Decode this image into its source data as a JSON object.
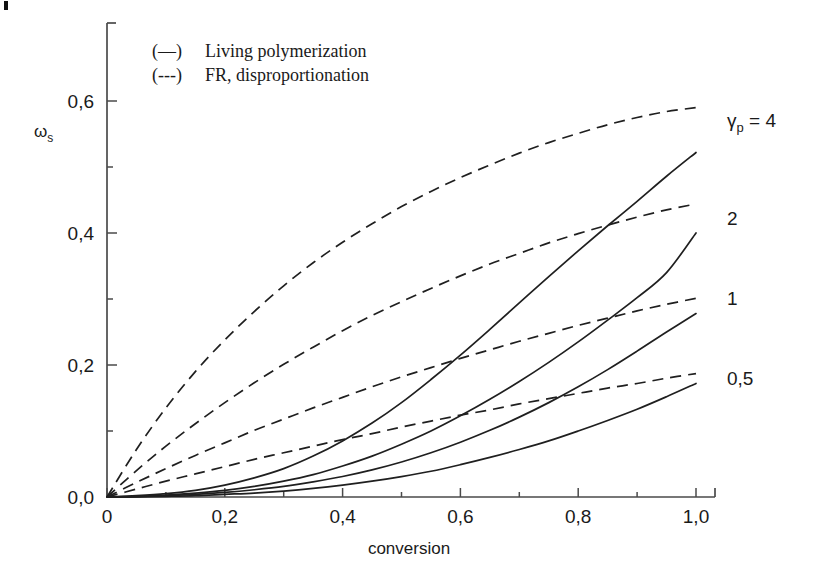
{
  "chart_data": {
    "type": "line",
    "title": "",
    "xlabel": "conversion",
    "ylabel": "ωs",
    "ylabel_parts": {
      "symbol": "ω",
      "sub": "s"
    },
    "xlim": [
      0,
      1.0
    ],
    "ylim": [
      0,
      0.68
    ],
    "grid": false,
    "legend_position": "top-left-inside",
    "x_ticks": [
      "0",
      "0,2",
      "0,4",
      "0,6",
      "0,8",
      "1,0"
    ],
    "x_tick_values": [
      0,
      0.2,
      0.4,
      0.6,
      0.8,
      1.0
    ],
    "x_minor_ticks": [
      0.1,
      0.3,
      0.5,
      0.7,
      0.9
    ],
    "y_ticks": [
      "0,0",
      "0,2",
      "0,4",
      "0,6"
    ],
    "y_tick_values": [
      0.0,
      0.2,
      0.4,
      0.6
    ],
    "y_minor_ticks": [
      0.1,
      0.3,
      0.5
    ],
    "legend": [
      {
        "marker": "(—)",
        "label": "Living polymerization",
        "style": "solid"
      },
      {
        "marker": "(---)",
        "label": "FR, disproportionation",
        "style": "dashed"
      }
    ],
    "curve_labels": [
      {
        "text": "γp = 4",
        "symbol": "γ",
        "sub": "p",
        "rest": " = 4",
        "value": 4
      },
      {
        "text": "2",
        "value": 2
      },
      {
        "text": "1",
        "value": 1
      },
      {
        "text": "0,5",
        "value": 0.5
      }
    ],
    "series": [
      {
        "name": "FR, disproportionation γp = 4",
        "style": "dashed",
        "gamma_p": 4,
        "x": [
          0,
          0.05,
          0.1,
          0.15,
          0.2,
          0.25,
          0.3,
          0.35,
          0.4,
          0.45,
          0.5,
          0.55,
          0.6,
          0.65,
          0.7,
          0.75,
          0.8,
          0.85,
          0.9,
          0.95,
          1.0
        ],
        "y": [
          0.0,
          0.072,
          0.135,
          0.19,
          0.238,
          0.281,
          0.32,
          0.355,
          0.386,
          0.414,
          0.44,
          0.463,
          0.484,
          0.503,
          0.521,
          0.537,
          0.551,
          0.564,
          0.575,
          0.584,
          0.59
        ]
      },
      {
        "name": "FR, disproportionation γp = 2",
        "style": "dashed",
        "gamma_p": 2,
        "x": [
          0,
          0.05,
          0.1,
          0.15,
          0.2,
          0.25,
          0.3,
          0.35,
          0.4,
          0.45,
          0.5,
          0.55,
          0.6,
          0.65,
          0.7,
          0.75,
          0.8,
          0.85,
          0.9,
          0.95,
          1.0
        ],
        "y": [
          0.0,
          0.04,
          0.077,
          0.111,
          0.143,
          0.173,
          0.201,
          0.227,
          0.252,
          0.275,
          0.296,
          0.316,
          0.335,
          0.353,
          0.369,
          0.385,
          0.399,
          0.412,
          0.424,
          0.435,
          0.444
        ]
      },
      {
        "name": "FR, disproportionation γp = 1",
        "style": "dashed",
        "gamma_p": 1,
        "x": [
          0,
          0.05,
          0.1,
          0.15,
          0.2,
          0.25,
          0.3,
          0.35,
          0.4,
          0.45,
          0.5,
          0.55,
          0.6,
          0.65,
          0.7,
          0.75,
          0.8,
          0.85,
          0.9,
          0.95,
          1.0
        ],
        "y": [
          0.0,
          0.022,
          0.043,
          0.063,
          0.082,
          0.101,
          0.118,
          0.135,
          0.151,
          0.167,
          0.182,
          0.196,
          0.21,
          0.223,
          0.236,
          0.248,
          0.26,
          0.271,
          0.282,
          0.292,
          0.301
        ]
      },
      {
        "name": "FR, disproportionation γp = 0,5",
        "style": "dashed",
        "gamma_p": 0.5,
        "x": [
          0,
          0.05,
          0.1,
          0.15,
          0.2,
          0.25,
          0.3,
          0.35,
          0.4,
          0.45,
          0.5,
          0.55,
          0.6,
          0.65,
          0.7,
          0.75,
          0.8,
          0.85,
          0.9,
          0.95,
          1.0
        ],
        "y": [
          0.0,
          0.012,
          0.024,
          0.035,
          0.046,
          0.057,
          0.067,
          0.077,
          0.087,
          0.096,
          0.106,
          0.115,
          0.124,
          0.132,
          0.141,
          0.149,
          0.157,
          0.165,
          0.172,
          0.18,
          0.187
        ]
      },
      {
        "name": "Living polymerization γp = 4",
        "style": "solid",
        "gamma_p": 4,
        "x": [
          0,
          0.05,
          0.1,
          0.15,
          0.2,
          0.25,
          0.3,
          0.35,
          0.4,
          0.45,
          0.5,
          0.55,
          0.6,
          0.65,
          0.7,
          0.75,
          0.8,
          0.85,
          0.9,
          0.95,
          1.0
        ],
        "y": [
          0.0,
          0.002,
          0.005,
          0.01,
          0.018,
          0.029,
          0.043,
          0.062,
          0.085,
          0.112,
          0.143,
          0.178,
          0.215,
          0.254,
          0.294,
          0.334,
          0.373,
          0.411,
          0.448,
          0.486,
          0.522
        ]
      },
      {
        "name": "Living polymerization γp = 2",
        "style": "solid",
        "gamma_p": 2,
        "x": [
          0,
          0.05,
          0.1,
          0.15,
          0.2,
          0.25,
          0.3,
          0.35,
          0.4,
          0.45,
          0.5,
          0.55,
          0.6,
          0.65,
          0.7,
          0.75,
          0.8,
          0.85,
          0.9,
          0.95,
          1.0
        ],
        "y": [
          0.0,
          0.001,
          0.003,
          0.006,
          0.01,
          0.016,
          0.024,
          0.034,
          0.047,
          0.062,
          0.08,
          0.1,
          0.123,
          0.148,
          0.175,
          0.204,
          0.235,
          0.268,
          0.302,
          0.34,
          0.4
        ]
      },
      {
        "name": "Living polymerization γp = 1",
        "style": "solid",
        "gamma_p": 1,
        "x": [
          0,
          0.05,
          0.1,
          0.15,
          0.2,
          0.25,
          0.3,
          0.35,
          0.4,
          0.45,
          0.5,
          0.55,
          0.6,
          0.65,
          0.7,
          0.75,
          0.8,
          0.85,
          0.9,
          0.95,
          1.0
        ],
        "y": [
          0.0,
          0.0005,
          0.002,
          0.004,
          0.007,
          0.011,
          0.016,
          0.023,
          0.031,
          0.041,
          0.053,
          0.067,
          0.083,
          0.101,
          0.121,
          0.143,
          0.167,
          0.193,
          0.221,
          0.25,
          0.278
        ]
      },
      {
        "name": "Living polymerization γp = 0,5",
        "style": "solid",
        "gamma_p": 0.5,
        "x": [
          0,
          0.05,
          0.1,
          0.15,
          0.2,
          0.25,
          0.3,
          0.35,
          0.4,
          0.45,
          0.5,
          0.55,
          0.6,
          0.65,
          0.7,
          0.75,
          0.8,
          0.85,
          0.9,
          0.95,
          1.0
        ],
        "y": [
          0.0,
          0.0003,
          0.001,
          0.002,
          0.004,
          0.006,
          0.009,
          0.013,
          0.018,
          0.024,
          0.031,
          0.039,
          0.049,
          0.06,
          0.072,
          0.085,
          0.1,
          0.116,
          0.133,
          0.152,
          0.172
        ]
      }
    ]
  },
  "colors": {
    "ink": "#1f1f1f",
    "axis": "#4a4a4a",
    "background": "#ffffff"
  }
}
